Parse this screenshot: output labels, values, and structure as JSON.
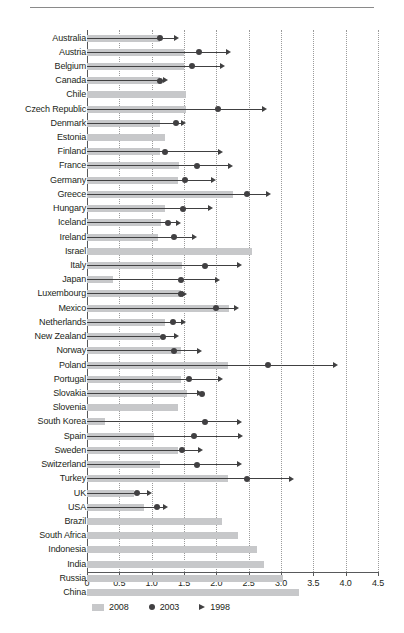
{
  "chart_data": {
    "type": "bar",
    "title": "",
    "subtitle": "",
    "xlabel": "",
    "ylabel": "",
    "xlim": [
      0,
      4.5
    ],
    "grid": true,
    "grid_axis": "x",
    "orientation": "horizontal",
    "legend_position": "bottom-left",
    "xticks": [
      "0",
      "0.5",
      "1.0",
      "1.5",
      "2.0",
      "2.5",
      "3.0",
      "3.5",
      "4.0",
      "4.5"
    ],
    "xtick_values": [
      0,
      0.5,
      1.0,
      1.5,
      2.0,
      2.5,
      3.0,
      3.5,
      4.0,
      4.5
    ],
    "legend": [
      {
        "name": "2008",
        "marker": "bar",
        "color": "#c7c8ca"
      },
      {
        "name": "2003",
        "marker": "circle",
        "color": "#414042"
      },
      {
        "name": "1998",
        "marker": "triangle",
        "color": "#414042"
      }
    ],
    "series": [
      {
        "name": "2008",
        "marker": "bar",
        "color": "#c7c8ca"
      },
      {
        "name": "2003",
        "marker": "circle",
        "color": "#414042"
      },
      {
        "name": "1998",
        "marker": "triangle",
        "color": "#414042"
      }
    ],
    "categories": [
      "Australia",
      "Austria",
      "Belgium",
      "Canada",
      "Chile",
      "Czech Republic",
      "Denmark",
      "Estonia",
      "Finland",
      "France",
      "Germany",
      "Greece",
      "Hungary",
      "Iceland",
      "Ireland",
      "Israel",
      "Italy",
      "Japan",
      "Luxembourg",
      "Mexico",
      "Netherlands",
      "New Zealand",
      "Norway",
      "Poland",
      "Portugal",
      "Slovakia",
      "Slovenia",
      "South Korea",
      "Spain",
      "Sweden",
      "Switzerland",
      "Turkey",
      "UK",
      "USA",
      "Brazil",
      "South Africa",
      "Indonesia",
      "India",
      "Russia",
      "China"
    ],
    "groups": [
      {
        "label": "",
        "start": 0,
        "count": 34
      },
      {
        "label": "",
        "start": 34,
        "count": 6
      }
    ],
    "rows": [
      {
        "category": "Australia",
        "v2008": 1.13,
        "v2003": 1.13,
        "v1998": 1.43
      },
      {
        "category": "Austria",
        "v2008": 1.5,
        "v2003": 1.73,
        "v1998": 2.23
      },
      {
        "category": "Belgium",
        "v2008": 1.5,
        "v2003": 1.63,
        "v1998": 2.13
      },
      {
        "category": "Canada",
        "v2008": 1.13,
        "v2003": 1.13,
        "v1998": 1.25
      },
      {
        "category": "Chile",
        "v2008": 1.53,
        "v2003": null,
        "v1998": null
      },
      {
        "category": "Czech Republic",
        "v2008": 1.53,
        "v2003": 2.03,
        "v1998": 2.78
      },
      {
        "category": "Denmark",
        "v2008": 1.13,
        "v2003": 1.38,
        "v1998": 1.53
      },
      {
        "category": "Estonia",
        "v2008": 1.2,
        "v2003": null,
        "v1998": null
      },
      {
        "category": "Finland",
        "v2008": 1.13,
        "v2003": 1.2,
        "v1998": 2.1
      },
      {
        "category": "France",
        "v2008": 1.43,
        "v2003": 1.7,
        "v1998": 2.25
      },
      {
        "category": "Germany",
        "v2008": 1.4,
        "v2003": 1.52,
        "v1998": 2.0
      },
      {
        "category": "Greece",
        "v2008": 2.25,
        "v2003": 2.47,
        "v1998": 2.85
      },
      {
        "category": "Hungary",
        "v2008": 1.2,
        "v2003": 1.48,
        "v1998": 1.95
      },
      {
        "category": "Iceland",
        "v2008": 1.15,
        "v2003": 1.25,
        "v1998": 1.45
      },
      {
        "category": "Ireland",
        "v2008": 1.1,
        "v2003": 1.35,
        "v1998": 1.7
      },
      {
        "category": "Israel",
        "v2008": 2.55,
        "v2003": null,
        "v1998": null
      },
      {
        "category": "Italy",
        "v2008": 1.47,
        "v2003": 1.83,
        "v1998": 2.4
      },
      {
        "category": "Japan",
        "v2008": 0.4,
        "v2003": 1.45,
        "v1998": 2.05
      },
      {
        "category": "Luxembourg",
        "v2008": 1.45,
        "v2003": 1.45,
        "v1998": 1.55
      },
      {
        "category": "Mexico",
        "v2008": 2.2,
        "v2003": 2.0,
        "v1998": 2.35
      },
      {
        "category": "Netherlands",
        "v2008": 1.2,
        "v2003": 1.33,
        "v1998": 1.53
      },
      {
        "category": "New Zealand",
        "v2008": 1.13,
        "v2003": 1.18,
        "v1998": 1.43
      },
      {
        "category": "Norway",
        "v2008": 1.45,
        "v2003": 1.35,
        "v1998": 1.78
      },
      {
        "category": "Poland",
        "v2008": 2.18,
        "v2003": 2.8,
        "v1998": 3.88
      },
      {
        "category": "Portugal",
        "v2008": 1.45,
        "v2003": 1.58,
        "v1998": 2.1
      },
      {
        "category": "Slovakia",
        "v2008": 1.55,
        "v2003": 1.78,
        "v1998": 1.78
      },
      {
        "category": "Slovenia",
        "v2008": 1.4,
        "v2003": null,
        "v1998": null
      },
      {
        "category": "South Korea",
        "v2008": 0.28,
        "v2003": 1.83,
        "v1998": 2.4
      },
      {
        "category": "Spain",
        "v2008": 1.03,
        "v2003": 1.65,
        "v1998": 2.42
      },
      {
        "category": "Sweden",
        "v2008": 1.4,
        "v2003": 1.47,
        "v1998": 1.8
      },
      {
        "category": "Switzerland",
        "v2008": 1.13,
        "v2003": 1.7,
        "v1998": 2.4
      },
      {
        "category": "Turkey",
        "v2008": 2.18,
        "v2003": 2.48,
        "v1998": 3.2
      },
      {
        "category": "UK",
        "v2008": 0.73,
        "v2003": 0.78,
        "v1998": 1.0
      },
      {
        "category": "USA",
        "v2008": 0.88,
        "v2003": 1.08,
        "v1998": 1.25
      },
      {
        "category": "Brazil",
        "v2008": 2.08,
        "v2003": null,
        "v1998": null
      },
      {
        "category": "South Africa",
        "v2008": 2.33,
        "v2003": null,
        "v1998": null
      },
      {
        "category": "Indonesia",
        "v2008": 2.63,
        "v2003": null,
        "v1998": null
      },
      {
        "category": "India",
        "v2008": 2.73,
        "v2003": null,
        "v1998": null
      },
      {
        "category": "Russia",
        "v2008": 3.03,
        "v2003": null,
        "v1998": null
      },
      {
        "category": "China",
        "v2008": 3.28,
        "v2003": null,
        "v1998": null
      }
    ]
  },
  "colors": {
    "bar_2008": "#c7c8ca",
    "marker_2003": "#414042",
    "marker_1998": "#404041",
    "axis": "#58595b",
    "grid": "#9b9b9b",
    "text": "#231f20",
    "background": "#ffffff"
  }
}
